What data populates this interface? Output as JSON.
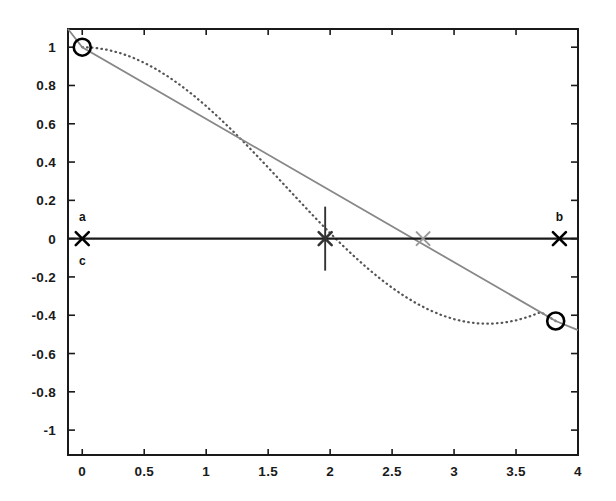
{
  "chart_data": {
    "type": "line",
    "title": "",
    "xlabel": "",
    "ylabel": "",
    "xlim": [
      -0.115,
      4.0
    ],
    "ylim": [
      -1.13,
      1.095
    ],
    "xticks": [
      "0",
      "0.5",
      "1",
      "1.5",
      "2",
      "2.5",
      "3",
      "3.5",
      "4"
    ],
    "xtick_values": [
      0,
      0.5,
      1,
      1.5,
      2,
      2.5,
      3,
      3.5,
      4
    ],
    "yticks": [
      "1",
      "0.8",
      "0.6",
      "0.4",
      "0.2",
      "0",
      "-0.2",
      "-0.4",
      "-0.6",
      "-0.8",
      "-1"
    ],
    "ytick_values": [
      1,
      0.8,
      0.6,
      0.4,
      0.2,
      0,
      -0.2,
      -0.4,
      -0.6,
      -0.8,
      -1
    ],
    "grid": false,
    "legend": "none",
    "series": [
      {
        "name": "function",
        "style": "dotted",
        "color": "#555555",
        "x": [
          0.0,
          0.1,
          0.2,
          0.3,
          0.4,
          0.5,
          0.6,
          0.7,
          0.8,
          0.9,
          1.0,
          1.1,
          1.2,
          1.3,
          1.4,
          1.5,
          1.6,
          1.7,
          1.8,
          1.9,
          2.0,
          2.1,
          2.2,
          2.3,
          2.4,
          2.5,
          2.6,
          2.7,
          2.8,
          2.9,
          3.0,
          3.1,
          3.2,
          3.3,
          3.4,
          3.5,
          3.6,
          3.7,
          3.82
        ],
        "y": [
          1.0,
          0.9967,
          0.9868,
          0.9705,
          0.9478,
          0.9189,
          0.8841,
          0.8436,
          0.7979,
          0.7473,
          0.6924,
          0.6336,
          0.5715,
          0.5067,
          0.4397,
          0.3713,
          0.302,
          0.2325,
          0.1634,
          0.0953,
          0.029,
          -0.035,
          -0.096,
          -0.1536,
          -0.2072,
          -0.2563,
          -0.3005,
          -0.3394,
          -0.3726,
          -0.3998,
          -0.4207,
          -0.4352,
          -0.4431,
          -0.4443,
          -0.4389,
          -0.4269,
          -0.4085,
          -0.3838,
          -0.43
        ]
      },
      {
        "name": "secant",
        "style": "solid",
        "color": "#888888",
        "x": [
          -0.115,
          0.0,
          3.82,
          4.0
        ],
        "y": [
          1.095,
          1.0,
          -0.43,
          -0.4779
        ]
      },
      {
        "name": "zero-axis",
        "style": "solid",
        "color": "#1a1a1a",
        "x": [
          -0.115,
          4.0
        ],
        "y": [
          0,
          0
        ]
      }
    ],
    "markers": [
      {
        "name": "endpoint-a",
        "shape": "circle",
        "x": 0.0,
        "y": 1.0,
        "color": "#000000"
      },
      {
        "name": "endpoint-b",
        "shape": "circle",
        "x": 3.82,
        "y": -0.43,
        "color": "#000000"
      },
      {
        "name": "point-a-cross",
        "shape": "x",
        "x": 0.0,
        "y": 0.0,
        "color": "#000000"
      },
      {
        "name": "point-b-cross",
        "shape": "x",
        "x": 3.85,
        "y": 0.0,
        "color": "#000000"
      },
      {
        "name": "point-c-cross",
        "shape": "x-with-vertical",
        "x": 1.96,
        "y": 0.0,
        "color": "#333333"
      },
      {
        "name": "point-secant-root",
        "shape": "x",
        "x": 2.75,
        "y": 0.0,
        "color": "#9a9a9a"
      }
    ],
    "annotations": [
      {
        "name": "label-a",
        "text": "a",
        "x": 0.0,
        "y": 0.115,
        "position": "above"
      },
      {
        "name": "label-c",
        "text": "c",
        "x": 0.0,
        "y": -0.115,
        "position": "below"
      },
      {
        "name": "label-b",
        "text": "b",
        "x": 3.85,
        "y": 0.115,
        "position": "above"
      }
    ]
  }
}
